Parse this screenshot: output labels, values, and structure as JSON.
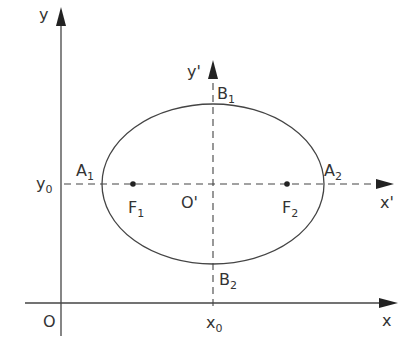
{
  "figure": {
    "type": "ellipse-translated-axes",
    "colors": {
      "stroke": "#444444",
      "text": "#333333",
      "background": "#ffffff"
    }
  },
  "axes": {
    "main_x": {
      "label": "x"
    },
    "main_y": {
      "label": "y"
    },
    "origin": {
      "label": "O"
    },
    "shifted_x": {
      "label": "x'"
    },
    "shifted_y": {
      "label": "y'"
    },
    "shifted_origin": {
      "label": "O'"
    },
    "x0": {
      "base": "x",
      "sub": "0"
    },
    "y0": {
      "base": "y",
      "sub": "0"
    }
  },
  "points": {
    "A1": {
      "base": "A",
      "sub": "1"
    },
    "A2": {
      "base": "A",
      "sub": "2"
    },
    "B1": {
      "base": "B",
      "sub": "1"
    },
    "B2": {
      "base": "B",
      "sub": "2"
    },
    "F1": {
      "base": "F",
      "sub": "1"
    },
    "F2": {
      "base": "F",
      "sub": "2"
    }
  }
}
